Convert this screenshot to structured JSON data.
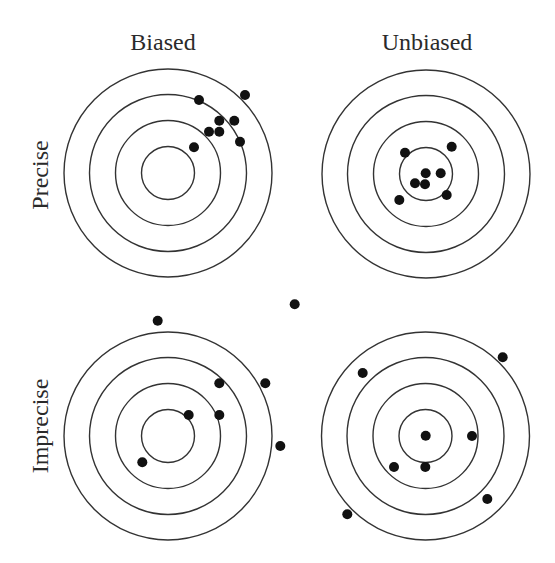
{
  "figure": {
    "column_labels": [
      "Biased",
      "Unbiased"
    ],
    "row_labels": [
      "Precise",
      "Imprecise"
    ],
    "colors": {
      "ring": "#333333",
      "shot": "#111111",
      "text": "#2a2a2a",
      "background": "#ffffff"
    },
    "ring_radii": [
      26.5,
      52.5,
      78.5,
      104
    ],
    "shot_radius": 5,
    "targets": [
      {
        "id": "biased-precise",
        "column": "Biased",
        "row": "Precise",
        "center": [
          168,
          173
        ],
        "shots": [
          [
            199,
            100
          ],
          [
            245,
            95
          ],
          [
            219.3,
            120.7
          ],
          [
            234.3,
            120.7
          ],
          [
            209,
            131.7
          ],
          [
            219.3,
            131.7
          ],
          [
            240,
            141.7
          ],
          [
            194,
            147.3
          ]
        ]
      },
      {
        "id": "unbiased-precise",
        "column": "Unbiased",
        "row": "Precise",
        "center": [
          426,
          174
        ],
        "shots": [
          [
            405,
            152.7
          ],
          [
            451.7,
            146.7
          ],
          [
            425.7,
            173.3
          ],
          [
            440.7,
            173.3
          ],
          [
            415,
            183.3
          ],
          [
            425,
            184.3
          ],
          [
            446.7,
            195
          ],
          [
            399.3,
            200
          ]
        ]
      },
      {
        "id": "biased-imprecise",
        "column": "Biased",
        "row": "Imprecise",
        "center": [
          168,
          436
        ],
        "shots": [
          [
            157.7,
            320.7
          ],
          [
            294.7,
            304.3
          ],
          [
            219.3,
            383.3
          ],
          [
            265.3,
            383.3
          ],
          [
            188.7,
            415
          ],
          [
            219.3,
            415
          ],
          [
            280.3,
            446
          ],
          [
            142.3,
            462.3
          ]
        ]
      },
      {
        "id": "unbiased-imprecise",
        "column": "Unbiased",
        "row": "Imprecise",
        "center": [
          425.5,
          436
        ],
        "shots": [
          [
            502.7,
            357.3
          ],
          [
            362.7,
            373
          ],
          [
            425.7,
            435.7
          ],
          [
            472,
            436
          ],
          [
            394,
            467
          ],
          [
            425.3,
            467
          ],
          [
            487.3,
            499
          ],
          [
            347.3,
            514.3
          ]
        ]
      }
    ]
  }
}
